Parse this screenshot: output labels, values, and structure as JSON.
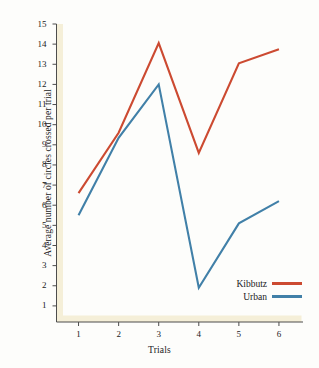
{
  "chart_data": {
    "type": "line",
    "title": "",
    "xlabel": "Trials",
    "ylabel": "Average number of circles crossed per trial",
    "x": [
      1,
      2,
      3,
      4,
      5,
      6
    ],
    "categories": [
      "1",
      "2",
      "3",
      "4",
      "5",
      "6"
    ],
    "xlim": [
      0.45,
      6.6
    ],
    "ylim": [
      0.2,
      15
    ],
    "xticks": [
      "1",
      "2",
      "3",
      "4",
      "5",
      "6"
    ],
    "yticks": [
      "1",
      "2",
      "3",
      "4",
      "5",
      "6",
      "7",
      "8",
      "9",
      "10",
      "11",
      "12",
      "13",
      "14",
      "15"
    ],
    "grid": false,
    "legend_position": "bottom-right",
    "series": [
      {
        "name": "Kibbutz",
        "color": "#cc4a31",
        "values": [
          6.6,
          9.6,
          14.05,
          8.6,
          13.05,
          13.75
        ]
      },
      {
        "name": "Urban",
        "color": "#4180a8",
        "values": [
          5.5,
          9.35,
          12.0,
          1.9,
          5.1,
          6.2
        ]
      }
    ]
  },
  "axis": {
    "band_color": "#f5efd8",
    "line_color": "#4d4d4d"
  },
  "legend": {
    "entries": [
      {
        "label": "Kibbutz",
        "color": "#cc4a31"
      },
      {
        "label": "Urban",
        "color": "#4180a8"
      }
    ]
  }
}
